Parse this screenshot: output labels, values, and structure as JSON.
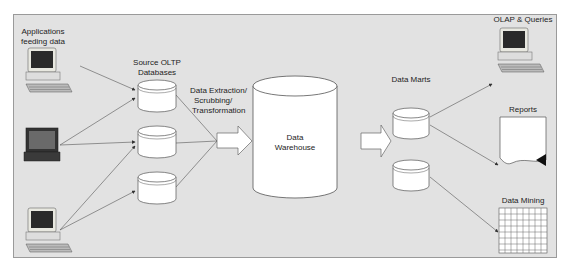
{
  "diagram": {
    "labels": {
      "applications": "Applications\nfeeding data",
      "applications_line1": "Applications",
      "applications_line2": "feeding data",
      "source_oltp_line1": "Source OLTP",
      "source_oltp_line2": "Databases",
      "extraction_line1": "Data Extraction/",
      "extraction_line2": "Scrubbing/",
      "extraction_line3": "Transformation",
      "warehouse_line1": "Data",
      "warehouse_line2": "Warehouse",
      "data_marts": "Data Marts",
      "olap": "OLAP & Queries",
      "reports": "Reports",
      "data_mining": "Data Mining"
    },
    "nodes": [
      {
        "id": "desktop-1",
        "type": "desktop-computer",
        "icon": "desktop-computer-icon"
      },
      {
        "id": "laptop",
        "type": "laptop-computer",
        "icon": "laptop-icon"
      },
      {
        "id": "desktop-2",
        "type": "desktop-computer",
        "icon": "desktop-computer-icon"
      },
      {
        "id": "oltp-db-1",
        "type": "database",
        "icon": "database-cylinder-icon"
      },
      {
        "id": "oltp-db-2",
        "type": "database",
        "icon": "database-cylinder-icon"
      },
      {
        "id": "oltp-db-3",
        "type": "database",
        "icon": "database-cylinder-icon"
      },
      {
        "id": "data-warehouse",
        "type": "database",
        "icon": "database-cylinder-icon"
      },
      {
        "id": "data-mart-1",
        "type": "database",
        "icon": "database-cylinder-icon"
      },
      {
        "id": "data-mart-2",
        "type": "database",
        "icon": "database-cylinder-icon"
      },
      {
        "id": "olap-terminal",
        "type": "desktop-computer",
        "icon": "desktop-computer-icon"
      },
      {
        "id": "reports-doc",
        "type": "document",
        "icon": "document-icon"
      },
      {
        "id": "mining-grid",
        "type": "grid",
        "icon": "grid-icon"
      }
    ],
    "edges": [
      {
        "from": "desktop-1",
        "to": "oltp-db-1"
      },
      {
        "from": "laptop",
        "to": "oltp-db-1"
      },
      {
        "from": "laptop",
        "to": "oltp-db-2"
      },
      {
        "from": "desktop-2",
        "to": "oltp-db-2"
      },
      {
        "from": "desktop-2",
        "to": "oltp-db-3"
      },
      {
        "from": "oltp-db-1",
        "to": "extraction-arrow"
      },
      {
        "from": "oltp-db-2",
        "to": "extraction-arrow"
      },
      {
        "from": "oltp-db-3",
        "to": "extraction-arrow"
      },
      {
        "from": "extraction-arrow",
        "to": "data-warehouse"
      },
      {
        "from": "data-warehouse",
        "to": "data-marts"
      },
      {
        "from": "data-mart-1",
        "to": "olap-terminal"
      },
      {
        "from": "data-mart-1",
        "to": "reports-doc"
      },
      {
        "from": "data-mart-2",
        "to": "mining-grid"
      }
    ],
    "colors": {
      "background": "#e2e2e2",
      "border": "#9a9a9a",
      "shape_fill": "#ffffff",
      "stroke": "#555555",
      "text": "#222222"
    }
  }
}
